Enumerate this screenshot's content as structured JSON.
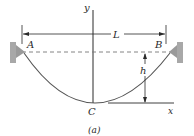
{
  "figure": {
    "caption": "(a)",
    "labels": {
      "y_axis": "y",
      "x_axis": "x",
      "span": "L",
      "left_support": "A",
      "right_support": "B",
      "lowest_point": "C",
      "sag": "h"
    },
    "colors": {
      "line": "#2a2a2a",
      "cable": "#555555",
      "dashed": "#777777",
      "support_fill": "#9a9a9a",
      "support_block": "#a8a8a8"
    }
  }
}
